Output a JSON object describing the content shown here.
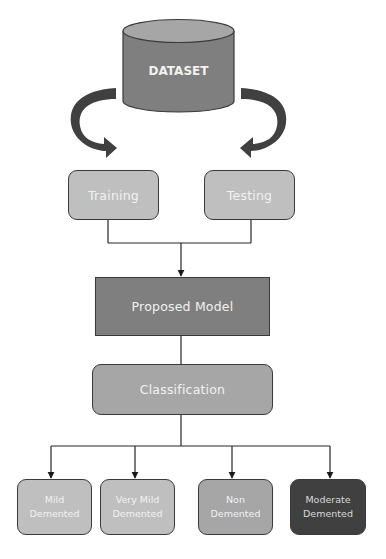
{
  "diagram": {
    "dataset": {
      "label": "DATASET",
      "body_color": "#7f7f7f",
      "top_color": "#a6a6a6"
    },
    "split": [
      {
        "label": "Training",
        "color": "#bfbfbf"
      },
      {
        "label": "Testing",
        "color": "#bfbfbf"
      }
    ],
    "model": {
      "label": "Proposed Model",
      "color": "#7f7f7f"
    },
    "classification": {
      "label": "Classification",
      "color": "#a6a6a6"
    },
    "classes": [
      {
        "line1": "Mild",
        "line2": "Demented",
        "color": "#bfbfbf"
      },
      {
        "line1": "Very Mild",
        "line2": "Demented",
        "color": "#bfbfbf"
      },
      {
        "line1": "Non",
        "line2": "Demented",
        "color": "#a6a6a6"
      },
      {
        "line1": "Moderate",
        "line2": "Demented",
        "color": "#404040"
      }
    ],
    "arrow_color": "#404040",
    "line_color": "#262626"
  }
}
